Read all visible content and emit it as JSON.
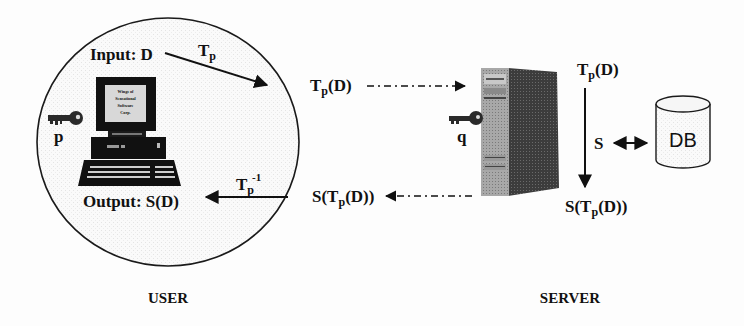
{
  "diagram": {
    "type": "client-server privacy-preserving computation flow",
    "user": {
      "section_label": "USER",
      "input_label": "Input: D",
      "output_label": "Output: S(D)",
      "key_label": "p",
      "transform_label": "T",
      "transform_sub": "p",
      "inverse_label": "T",
      "inverse_sub": "p",
      "inverse_sup": "-1",
      "computer_screen_text": [
        "Wings of",
        "Sensational",
        "Software",
        "Corp."
      ]
    },
    "channel": {
      "outgoing_label": {
        "base": "T",
        "sub": "p",
        "rest": "(D)"
      },
      "incoming_label": {
        "prefix": "S(T",
        "sub": "p",
        "rest": "(D))"
      }
    },
    "server": {
      "section_label": "SERVER",
      "key_label": "q",
      "top_label": {
        "base": "T",
        "sub": "p",
        "rest": "(D)"
      },
      "bottom_label": {
        "prefix": "S(T",
        "sub": "p",
        "rest": "(D))"
      },
      "operation_label": "S",
      "database_label": "DB"
    },
    "colors": {
      "stroke": "#1a1a1a",
      "server_front": "#9a9a9a",
      "server_side": "#3a3a3a",
      "db_fill": "#f2f2f2"
    }
  }
}
